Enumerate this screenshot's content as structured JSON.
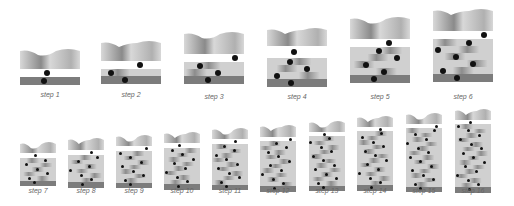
{
  "colors": {
    "surface_light": "#d8d8d8",
    "surface_dark": "#8a8a8a",
    "layer_light": "#d0d0d0",
    "layer_dark": "#8c8c8c",
    "base": "#7c7c7c",
    "bead": "#111111",
    "label": "#666666"
  },
  "steps": [
    {
      "label": "step 1"
    },
    {
      "label": "step 2"
    },
    {
      "label": "step 3"
    },
    {
      "label": "step 4"
    },
    {
      "label": "step 5"
    },
    {
      "label": "step 6"
    },
    {
      "label": "step 7"
    },
    {
      "label": "step 8"
    },
    {
      "label": "step 9"
    },
    {
      "label": "step 10"
    },
    {
      "label": "step 11"
    },
    {
      "label": "step 12"
    },
    {
      "label": "step 13"
    },
    {
      "label": "step 14"
    },
    {
      "label": "step 15"
    },
    {
      "label": "step 16"
    }
  ]
}
